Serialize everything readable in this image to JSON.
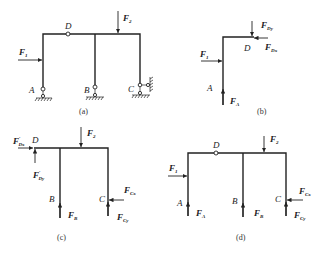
{
  "figure": {
    "panels": [
      {
        "id": "a",
        "caption": "(a)",
        "points": {
          "A": "A",
          "B": "B",
          "C": "C",
          "D": "D"
        },
        "forces": {
          "F1": {
            "main": "F",
            "sub": "1"
          },
          "F2": {
            "main": "F",
            "sub": "2"
          }
        },
        "description": "Compound frame with hinge D, pin supports at A and B, fixed-pin with roller/lateral restraint at C"
      },
      {
        "id": "b",
        "caption": "(b)",
        "points": {
          "A": "A",
          "D": "D"
        },
        "forces": {
          "F1": {
            "main": "F",
            "sub": "1"
          },
          "FDy": {
            "main": "F",
            "sub": "Dy"
          },
          "FDx": {
            "main": "F",
            "sub": "Dx"
          },
          "FA": {
            "main": "F",
            "sub": "A"
          }
        },
        "description": "Free body diagram of member AD"
      },
      {
        "id": "c",
        "caption": "(c)",
        "points": {
          "B": "B",
          "C": "C",
          "D": "D"
        },
        "forces": {
          "FDx_p": {
            "main": "F",
            "prime": "′",
            "sub": "Dx"
          },
          "FDy_p": {
            "main": "F",
            "prime": "′",
            "sub": "Dy"
          },
          "F2": {
            "main": "F",
            "sub": "2"
          },
          "FB": {
            "main": "F",
            "sub": "B"
          },
          "FCx": {
            "main": "F",
            "sub": "Cx"
          },
          "FCy": {
            "main": "F",
            "sub": "Cy"
          }
        },
        "description": "Free body diagram of member DBC"
      },
      {
        "id": "d",
        "caption": "(d)",
        "points": {
          "A": "A",
          "B": "B",
          "C": "C",
          "D": "D"
        },
        "forces": {
          "F1": {
            "main": "F",
            "sub": "1"
          },
          "F2": {
            "main": "F",
            "sub": "2"
          },
          "FA": {
            "main": "F",
            "sub": "A"
          },
          "FB": {
            "main": "F",
            "sub": "B"
          },
          "FCx": {
            "main": "F",
            "sub": "Cx"
          },
          "FCy": {
            "main": "F",
            "sub": "Cy"
          }
        },
        "description": "Free body diagram of whole frame"
      }
    ]
  }
}
